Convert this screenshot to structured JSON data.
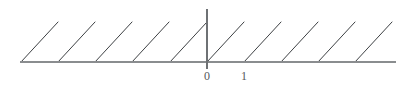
{
  "figure": {
    "title": "",
    "background_color": "#ffffff",
    "width": 415,
    "height": 93
  },
  "axes": {
    "x_axis": {
      "name": "x-axis",
      "color": "#8a8d8f",
      "y_pixel": 62,
      "x_start_pixel": 20,
      "x_end_pixel": 396
    },
    "y_axis": {
      "name": "y-axis",
      "color": "#6e7174",
      "x_pixel": 207,
      "y_top_pixel": 9,
      "y_bottom_pixel": 69
    }
  },
  "tick_labels": [
    {
      "text": "0",
      "x_data": 0,
      "x_pixel": 207,
      "y_pixel": 70
    },
    {
      "text": "1",
      "x_data": 1,
      "x_pixel": 244,
      "y_pixel": 70
    }
  ],
  "chart_data": {
    "type": "line",
    "title": "",
    "subtitle": "",
    "xlabel": "",
    "ylabel": "",
    "function": "y = x - floor(x)  (fractional part / sawtooth wave)",
    "period": 1,
    "amplitude": 1,
    "xlim": [
      -5,
      5.1
    ],
    "ylim": [
      0,
      1.08
    ],
    "xticks": [
      0,
      1
    ],
    "xticklabels": [
      "0",
      "1"
    ],
    "yticks": [],
    "yticklabels": [],
    "grid": false,
    "legend": null,
    "line_color": "#3d4043",
    "line_width": 1,
    "series": [
      {
        "name": "sawtooth",
        "segments": [
          {
            "x": [
              -5,
              -4
            ],
            "y": [
              0,
              1
            ]
          },
          {
            "x": [
              -4,
              -3
            ],
            "y": [
              0,
              1
            ]
          },
          {
            "x": [
              -3,
              -2
            ],
            "y": [
              0,
              1
            ]
          },
          {
            "x": [
              -2,
              -1
            ],
            "y": [
              0,
              1
            ]
          },
          {
            "x": [
              -1,
              0
            ],
            "y": [
              0,
              1
            ]
          },
          {
            "x": [
              0,
              1
            ],
            "y": [
              0,
              1
            ]
          },
          {
            "x": [
              1,
              2
            ],
            "y": [
              0,
              1
            ]
          },
          {
            "x": [
              2,
              3
            ],
            "y": [
              0,
              1
            ]
          },
          {
            "x": [
              3,
              4
            ],
            "y": [
              0,
              1
            ]
          },
          {
            "x": [
              4,
              5
            ],
            "y": [
              0,
              1
            ]
          }
        ]
      }
    ],
    "pixel_geometry": {
      "baseline_y": 62,
      "peak_y": 22,
      "tooth_width": 37,
      "tooth_base_x": [
        21,
        58,
        95,
        132,
        170,
        207,
        244,
        281,
        318,
        355
      ],
      "tooth_count": 10
    }
  }
}
